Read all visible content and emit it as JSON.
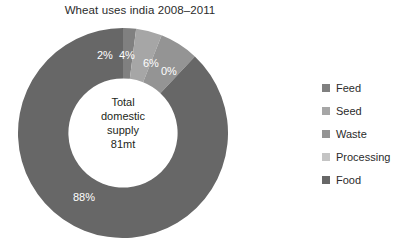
{
  "chart_data": {
    "type": "pie",
    "variant": "doughnut",
    "title": "Wheat uses india 2008–2011",
    "xlabel": "",
    "ylabel": "",
    "legend_position": "right",
    "grid": false,
    "start_angle_deg": 0,
    "direction": "clockwise",
    "hole_ratio": 0.52,
    "center_label": {
      "line1": "Total",
      "line2": "domestic",
      "line3": "supply",
      "line4": "81mt"
    },
    "categories": [
      "Feed",
      "Seed",
      "Waste",
      "Processing",
      "Food"
    ],
    "values": [
      2,
      4,
      6,
      0,
      88
    ],
    "value_labels": [
      "2%",
      "4%",
      "6%",
      "0%",
      "88%"
    ],
    "colors": [
      "#808080",
      "#a6a6a6",
      "#949494",
      "#c4c4c4",
      "#676767"
    ],
    "slices": [
      {
        "name": "Feed",
        "value": 2,
        "label": "2%",
        "color": "#808080"
      },
      {
        "name": "Seed",
        "value": 4,
        "label": "4%",
        "color": "#a6a6a6"
      },
      {
        "name": "Waste",
        "value": 6,
        "label": "6%",
        "color": "#949494"
      },
      {
        "name": "Processing",
        "value": 0,
        "label": "0%",
        "color": "#c4c4c4"
      },
      {
        "name": "Food",
        "value": 88,
        "label": "88%",
        "color": "#676767"
      }
    ]
  },
  "legend": {
    "items": [
      {
        "label": "Feed",
        "color": "#808080"
      },
      {
        "label": "Seed",
        "color": "#a6a6a6"
      },
      {
        "label": "Waste",
        "color": "#949494"
      },
      {
        "label": "Processing",
        "color": "#c4c4c4"
      },
      {
        "label": "Food",
        "color": "#676767"
      }
    ]
  }
}
